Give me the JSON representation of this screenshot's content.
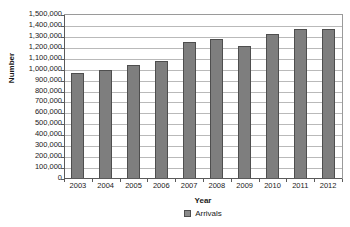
{
  "chart_data": {
    "type": "bar",
    "title": "",
    "xlabel": "Year",
    "ylabel": "Number",
    "categories": [
      "2003",
      "2004",
      "2005",
      "2006",
      "2007",
      "2008",
      "2009",
      "2010",
      "2011",
      "2012"
    ],
    "values": [
      970000,
      1000000,
      1045000,
      1080000,
      1250000,
      1285000,
      1215000,
      1325000,
      1375000,
      1375000
    ],
    "series": [
      {
        "name": "Arrivals",
        "values": [
          970000,
          1000000,
          1045000,
          1080000,
          1250000,
          1285000,
          1215000,
          1325000,
          1375000,
          1375000
        ]
      }
    ],
    "ylim": [
      0,
      1500000
    ],
    "ytick_step": 100000,
    "ytick_labels": [
      "1,500,000",
      "1,400,000",
      "1,300,000",
      "1,200,000",
      "1,100,000",
      "1,000,000",
      "900,000",
      "800,000",
      "700,000",
      "600,000",
      "500,000",
      "400,000",
      "300,000",
      "200,000",
      "100,000",
      "0"
    ],
    "ytick_values": [
      1500000,
      1400000,
      1300000,
      1200000,
      1100000,
      1000000,
      900000,
      800000,
      700000,
      600000,
      500000,
      400000,
      300000,
      200000,
      100000,
      0
    ],
    "grid": true,
    "legend": {
      "position": "bottom",
      "entries": [
        {
          "label": "Arrivals",
          "color": "#8a8a8a"
        }
      ]
    },
    "colors": {
      "bar_fill": "#7e7e7e",
      "bar_stroke": "#4e4e4e",
      "gridline": "#b9b9b9",
      "axis": "#5a5a5a",
      "background": "#ffffff",
      "text": "#1a1a1a"
    }
  }
}
